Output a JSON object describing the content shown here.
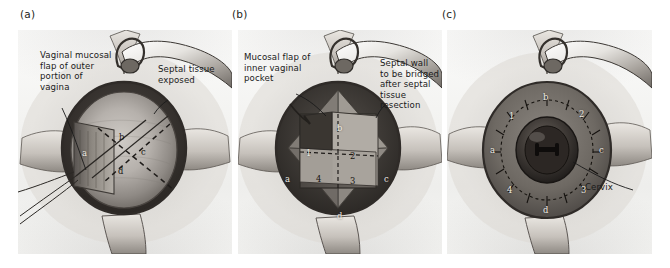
{
  "figure": {
    "background_color": "#ffffff",
    "plate_color": "#f2f2f0",
    "ink_color": "#1a1a1a"
  },
  "panels": [
    {
      "tag": "(a)",
      "name": "panel-a",
      "callouts": [
        {
          "name": "vaginal-mucosal-flap-label",
          "text": "Vaginal mucosal\nflap of outer\nportion of\nvagina"
        },
        {
          "name": "septal-tissue-exposed-label",
          "text": "Septal tissue\nexposed"
        }
      ],
      "markers": [
        {
          "name": "marker-a",
          "text": "a"
        },
        {
          "name": "marker-b",
          "text": "b"
        },
        {
          "name": "marker-c",
          "text": "c"
        },
        {
          "name": "marker-d",
          "text": "d"
        }
      ]
    },
    {
      "tag": "(b)",
      "name": "panel-b",
      "callouts": [
        {
          "name": "mucosal-flap-inner-pocket-label",
          "text": "Mucosal flap of\ninner vaginal\npocket"
        },
        {
          "name": "septal-wall-bridged-label",
          "text": "Septal wall\nto be bridged\nafter septal\ntissue\nresection"
        }
      ],
      "markers": [
        {
          "name": "marker-a",
          "text": "a"
        },
        {
          "name": "marker-b",
          "text": "b"
        },
        {
          "name": "marker-c",
          "text": "c"
        },
        {
          "name": "marker-d",
          "text": "d"
        },
        {
          "name": "marker-1",
          "text": "1"
        },
        {
          "name": "marker-2",
          "text": "2"
        },
        {
          "name": "marker-3",
          "text": "3"
        },
        {
          "name": "marker-4",
          "text": "4"
        }
      ]
    },
    {
      "tag": "(c)",
      "name": "panel-c",
      "callouts": [
        {
          "name": "cervix-label",
          "text": "Cervix"
        }
      ],
      "markers": [
        {
          "name": "marker-a",
          "text": "a"
        },
        {
          "name": "marker-b",
          "text": "b"
        },
        {
          "name": "marker-c",
          "text": "c"
        },
        {
          "name": "marker-d",
          "text": "d"
        },
        {
          "name": "marker-1",
          "text": "1"
        },
        {
          "name": "marker-2",
          "text": "2"
        },
        {
          "name": "marker-3",
          "text": "3"
        },
        {
          "name": "marker-4",
          "text": "4"
        }
      ]
    }
  ]
}
